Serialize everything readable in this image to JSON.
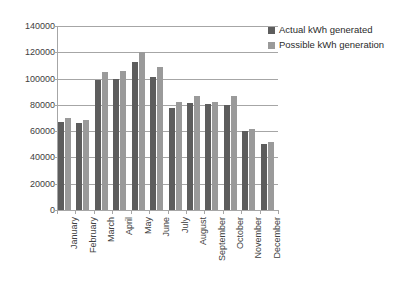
{
  "chart_data": {
    "type": "bar",
    "title": "",
    "xlabel": "",
    "ylabel": "",
    "ylim": [
      0,
      140000
    ],
    "ytick_step": 20000,
    "grid": true,
    "legend_position": "top-right",
    "categories": [
      "January",
      "February",
      "March",
      "April",
      "May",
      "June",
      "July",
      "August",
      "September",
      "October",
      "November",
      "December"
    ],
    "ytick_labels": [
      "0",
      "20000",
      "40000",
      "60000",
      "80000",
      "100000",
      "120000",
      "140000"
    ],
    "series": [
      {
        "name": "Actual kWh generated",
        "color": "#5d5d5d",
        "values": [
          67000,
          66000,
          99000,
          99500,
          112500,
          101000,
          78000,
          81500,
          80500,
          80000,
          60500,
          50000
        ]
      },
      {
        "name": "Possible kWh generation",
        "color": "#9a9a9a",
        "values": [
          70000,
          68500,
          105000,
          106000,
          120000,
          108500,
          82000,
          86500,
          82000,
          86500,
          61500,
          51500
        ]
      }
    ]
  },
  "legend": {
    "items": [
      {
        "label": "Actual kWh generated",
        "swatch": "actual"
      },
      {
        "label": "Possible kWh generation",
        "swatch": "possible"
      }
    ]
  }
}
